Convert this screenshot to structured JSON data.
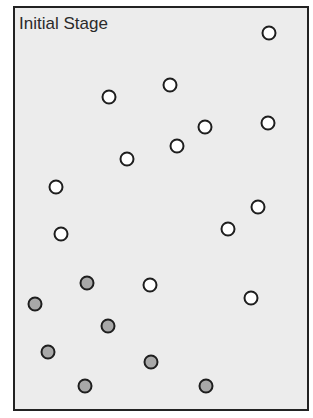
{
  "title": "Initial Stage",
  "colors": {
    "open": "#ffffff",
    "filled": "#a8a8a8",
    "background": "#ececec"
  },
  "particles": [
    {
      "x": 269,
      "y": 33,
      "state": "open"
    },
    {
      "x": 170,
      "y": 85,
      "state": "open"
    },
    {
      "x": 109,
      "y": 97,
      "state": "open"
    },
    {
      "x": 205,
      "y": 127,
      "state": "open"
    },
    {
      "x": 268,
      "y": 123,
      "state": "open"
    },
    {
      "x": 177,
      "y": 146,
      "state": "open"
    },
    {
      "x": 127,
      "y": 159,
      "state": "open"
    },
    {
      "x": 56,
      "y": 187,
      "state": "open"
    },
    {
      "x": 258,
      "y": 207,
      "state": "open"
    },
    {
      "x": 228,
      "y": 229,
      "state": "open"
    },
    {
      "x": 61,
      "y": 234,
      "state": "open"
    },
    {
      "x": 87,
      "y": 283,
      "state": "filled"
    },
    {
      "x": 150,
      "y": 285,
      "state": "open"
    },
    {
      "x": 35,
      "y": 304,
      "state": "filled"
    },
    {
      "x": 251,
      "y": 298,
      "state": "open"
    },
    {
      "x": 108,
      "y": 326,
      "state": "filled"
    },
    {
      "x": 48,
      "y": 352,
      "state": "filled"
    },
    {
      "x": 151,
      "y": 362,
      "state": "filled"
    },
    {
      "x": 85,
      "y": 386,
      "state": "filled"
    },
    {
      "x": 206,
      "y": 386,
      "state": "filled"
    }
  ]
}
